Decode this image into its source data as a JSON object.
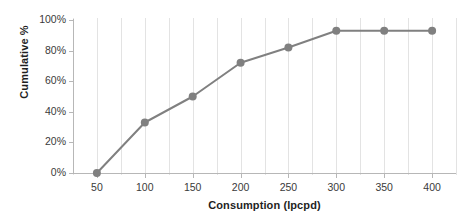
{
  "chart_data": {
    "type": "line",
    "title": "",
    "xlabel": "Consumption (lpcpd)",
    "ylabel": "Cumulative %",
    "x": [
      50,
      100,
      150,
      200,
      250,
      300,
      350,
      400
    ],
    "values": [
      0,
      33,
      50,
      72,
      82,
      93,
      93,
      93
    ],
    "series": [
      {
        "name": "Cumulative %",
        "x": [
          50,
          100,
          150,
          200,
          250,
          300,
          350,
          400
        ],
        "values": [
          0,
          33,
          50,
          72,
          82,
          93,
          93,
          93
        ]
      }
    ],
    "xlim": [
      25,
      425
    ],
    "ylim": [
      0,
      100
    ],
    "x_ticks": [
      50,
      100,
      150,
      200,
      250,
      300,
      350,
      400
    ],
    "x_tick_labels": [
      "50",
      "100",
      "150",
      "200",
      "250",
      "300",
      "350",
      "400"
    ],
    "y_ticks": [
      0,
      20,
      40,
      60,
      80,
      100
    ],
    "y_tick_labels": [
      "0%",
      "20%",
      "40%",
      "60%",
      "80%",
      "100%"
    ],
    "grid": {
      "vertical": true,
      "horizontal": false,
      "vertical_interval": 25,
      "color": "#e3e3e3"
    },
    "legend": {
      "visible": false,
      "position": "none"
    },
    "style": {
      "line_color": "#808080",
      "marker_color": "#808080",
      "marker_shape": "circle",
      "line_width": 2,
      "marker_size": 4,
      "axis_color": "#b7b7b7",
      "text_color": "#3a3a3a",
      "title_color": "#1f1f1f",
      "background": "#ffffff"
    }
  }
}
